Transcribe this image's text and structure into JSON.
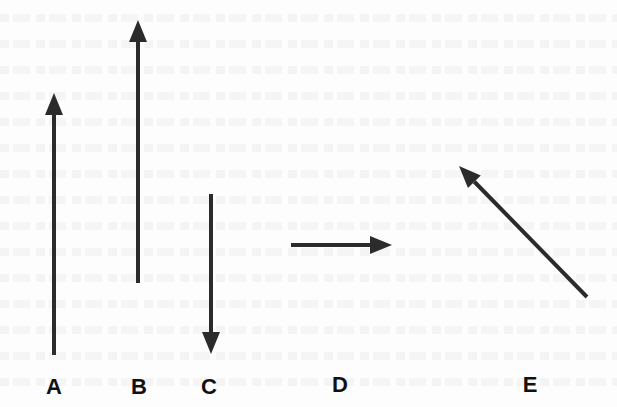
{
  "diagram": {
    "type": "vector-arrows",
    "stroke_color": "#2b2b2b",
    "label_color": "#111111",
    "arrows": [
      {
        "label": "A",
        "x1": 54,
        "y1": 355,
        "x2": 54,
        "y2": 93,
        "direction": "up",
        "label_x": 54
      },
      {
        "label": "B",
        "x1": 138,
        "y1": 283,
        "x2": 138,
        "y2": 20,
        "direction": "up",
        "label_x": 139
      },
      {
        "label": "C",
        "x1": 211,
        "y1": 194,
        "x2": 211,
        "y2": 354,
        "direction": "down",
        "label_x": 209
      },
      {
        "label": "D",
        "x1": 291,
        "y1": 245,
        "x2": 392,
        "y2": 245,
        "direction": "right",
        "label_x": 340
      },
      {
        "label": "E",
        "x1": 587,
        "y1": 297,
        "x2": 459,
        "y2": 166,
        "direction": "up-left",
        "label_x": 530
      }
    ]
  },
  "labels": {
    "a": "A",
    "b": "B",
    "c": "C",
    "d": "D",
    "e": "E"
  }
}
